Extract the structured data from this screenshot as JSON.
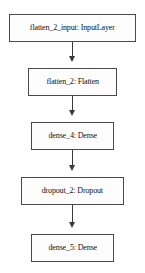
{
  "diagram": {
    "background_color": "#ffffff",
    "node_border_color": "#4a4a4a",
    "node_fill_color": "#fdfdfd",
    "edge_color": "#3a3a3a",
    "text_color": "#111111",
    "nodes": [
      {
        "id": "flatten_2_input",
        "label": "flatten_2_input: InputLayer",
        "layer_name": "flatten_2_input",
        "layer_type": "InputLayer",
        "x": 9,
        "y": 14,
        "width": 127,
        "height": 28,
        "font_size": 8.2
      },
      {
        "id": "flatten_2",
        "label": "flatten_2: Flatten",
        "layer_name": "flatten_2",
        "layer_type": "Flatten",
        "x": 28,
        "y": 68,
        "width": 89,
        "height": 28,
        "font_size": 8.2
      },
      {
        "id": "dense_4",
        "label": "dense_4: Dense",
        "layer_name": "dense_4",
        "layer_type": "Dense",
        "x": 31,
        "y": 122,
        "width": 83,
        "height": 28,
        "font_size": 8.2
      },
      {
        "id": "dropout_2",
        "label": "dropout_2: Dropout",
        "layer_name": "dropout_2",
        "layer_type": "Dropout",
        "x": 21,
        "y": 177,
        "width": 103,
        "height": 28,
        "font_size": 8.2
      },
      {
        "id": "dense_5",
        "label": "dense_5: Dense",
        "layer_name": "dense_5",
        "layer_type": "Dense",
        "x": 31,
        "y": 234,
        "width": 83,
        "height": 28,
        "font_size": 8.2
      }
    ],
    "edges": [
      {
        "from": "flatten_2_input",
        "to": "flatten_2",
        "x": 72,
        "y": 42,
        "length": 20
      },
      {
        "from": "flatten_2",
        "to": "dense_4",
        "x": 72,
        "y": 96,
        "length": 20
      },
      {
        "from": "dense_4",
        "to": "dropout_2",
        "x": 72,
        "y": 150,
        "length": 21
      },
      {
        "from": "dropout_2",
        "to": "dense_5",
        "x": 72,
        "y": 205,
        "length": 23
      }
    ]
  }
}
